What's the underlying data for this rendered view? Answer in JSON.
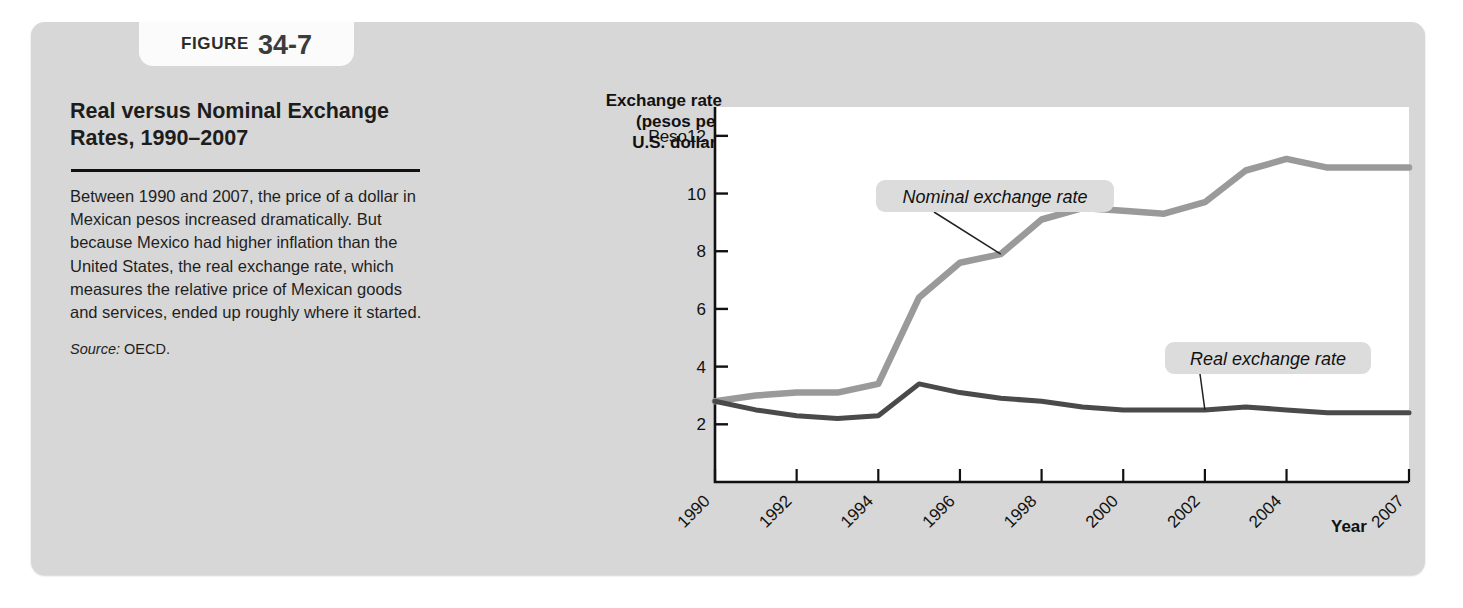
{
  "figure": {
    "label_word": "FIGURE",
    "number": "34-7",
    "title": "Real versus Nominal Exchange Rates, 1990–2007",
    "caption": "Between 1990 and 2007, the price of a dollar in Mexican pesos increased dramatically. But because Mexico had higher inflation than the United States, the real exchange rate, which measures the relative price of Mexican goods and services, ended up roughly where it started.",
    "source_label": "Source:",
    "source_value": "OECD."
  },
  "colors": {
    "panel_bg": "#d7d7d7",
    "tab_bg": "#fbfbfb",
    "plot_bg": "#ffffff",
    "nominal_line": "#9a9a9a",
    "real_line": "#4a4a4a",
    "axis": "#111111",
    "annotation_bg": "#dcdcdc"
  },
  "chart_data": {
    "type": "line",
    "title": "Real versus Nominal Exchange Rates, 1990–2007",
    "ylabel": "Exchange rate (pesos per U.S. dollar)",
    "ylabel_lines": [
      "Exchange rate",
      "(pesos per",
      "U.S. dollar)"
    ],
    "xlabel": "Year",
    "ylim": [
      0,
      13
    ],
    "yticks": [
      2,
      4,
      6,
      8,
      10,
      12
    ],
    "ytick_labels": [
      "2",
      "4",
      "6",
      "8",
      "10",
      "Peso12"
    ],
    "y_unit_prefix": "Peso",
    "xlim": [
      1990,
      2007
    ],
    "xticks": [
      1990,
      1992,
      1994,
      1996,
      1998,
      2000,
      2002,
      2004,
      2007
    ],
    "xtick_labels": [
      "1990",
      "1992",
      "1994",
      "1996",
      "1998",
      "2000",
      "2002",
      "2004",
      "2007"
    ],
    "xtick_rotation_deg": 45,
    "grid": false,
    "legend_position": "inline-annotations",
    "x": [
      1990,
      1991,
      1992,
      1993,
      1994,
      1995,
      1996,
      1997,
      1998,
      1999,
      2000,
      2001,
      2002,
      2003,
      2004,
      2005,
      2006,
      2007
    ],
    "series": [
      {
        "name": "Nominal exchange rate",
        "color": "#9a9a9a",
        "values": [
          2.8,
          3.0,
          3.1,
          3.1,
          3.4,
          6.4,
          7.6,
          7.9,
          9.1,
          9.5,
          9.4,
          9.3,
          9.7,
          10.8,
          11.2,
          10.9,
          10.9,
          10.9
        ]
      },
      {
        "name": "Real exchange rate",
        "color": "#4a4a4a",
        "values": [
          2.8,
          2.5,
          2.3,
          2.2,
          2.3,
          3.4,
          3.1,
          2.9,
          2.8,
          2.6,
          2.5,
          2.5,
          2.5,
          2.6,
          2.5,
          2.4,
          2.4,
          2.4
        ]
      }
    ],
    "annotations": [
      {
        "text": "Nominal exchange rate",
        "points_to_year": 1997
      },
      {
        "text": "Real exchange rate",
        "points_to_year": 2002
      }
    ]
  }
}
